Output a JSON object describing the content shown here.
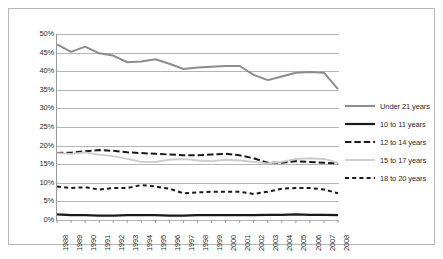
{
  "chart_data": {
    "type": "line",
    "title": "",
    "subtitle": "",
    "xlabel": "",
    "ylabel": "",
    "x": [
      1988,
      1989,
      1990,
      1991,
      1992,
      1993,
      1994,
      1995,
      1996,
      1997,
      1998,
      1999,
      2000,
      2001,
      2002,
      2003,
      2004,
      2005,
      2006,
      2007,
      2008
    ],
    "categories": [
      "1988",
      "1989",
      "1990",
      "1991",
      "1992",
      "1993",
      "1994",
      "1995",
      "1996",
      "1997",
      "1998",
      "1999",
      "2000",
      "2001",
      "2002",
      "2003",
      "2004",
      "2005",
      "2006",
      "2007",
      "2008"
    ],
    "ylim": [
      0,
      50
    ],
    "ytick_values": [
      0,
      5,
      10,
      15,
      20,
      25,
      30,
      35,
      40,
      45,
      50
    ],
    "ytick_labels": [
      "0%",
      "5%",
      "10%",
      "15%",
      "20%",
      "25%",
      "30%",
      "35%",
      "40%",
      "45%",
      "50%"
    ],
    "grid": true,
    "grid_axis": "y",
    "legend_position": "right",
    "series": [
      {
        "name": "Under 21 years",
        "style": "solid",
        "color": "#8c8c8c",
        "width": 2.0,
        "values": [
          47.2,
          45.2,
          46.6,
          44.8,
          44.2,
          42.4,
          42.6,
          43.2,
          42.0,
          40.6,
          41.0,
          41.2,
          41.4,
          41.4,
          39.0,
          37.6,
          38.6,
          39.6,
          39.8,
          39.6,
          35.2
        ]
      },
      {
        "name": "10 to 11 years",
        "style": "solid",
        "color": "#1a1a1a",
        "width": 2.2,
        "values": [
          1.5,
          1.3,
          1.3,
          1.2,
          1.2,
          1.3,
          1.3,
          1.3,
          1.2,
          1.2,
          1.3,
          1.3,
          1.3,
          1.3,
          1.3,
          1.4,
          1.4,
          1.5,
          1.4,
          1.4,
          1.3
        ]
      },
      {
        "name": "12 to 14 years",
        "style": "dashed",
        "color": "#1a1a1a",
        "width": 2.0,
        "values": [
          18.0,
          18.1,
          18.5,
          18.8,
          18.6,
          18.2,
          18.0,
          17.8,
          17.6,
          17.4,
          17.4,
          17.6,
          17.8,
          17.4,
          16.6,
          15.4,
          15.4,
          15.8,
          15.6,
          15.4,
          15.2
        ]
      },
      {
        "name": "15 to 17 years",
        "style": "solid",
        "color": "#cccccc",
        "width": 1.8,
        "values": [
          18.0,
          17.8,
          18.2,
          17.6,
          17.2,
          16.4,
          15.6,
          15.6,
          16.2,
          16.4,
          16.0,
          15.8,
          16.2,
          16.0,
          15.6,
          15.2,
          15.6,
          16.4,
          16.6,
          16.4,
          15.4
        ]
      },
      {
        "name": "18 to 20 years",
        "style": "dotted",
        "color": "#1a1a1a",
        "width": 2.0,
        "values": [
          9.0,
          8.6,
          8.8,
          8.2,
          8.6,
          8.6,
          9.4,
          9.0,
          8.4,
          7.2,
          7.4,
          7.6,
          7.6,
          7.6,
          7.0,
          7.6,
          8.4,
          8.6,
          8.6,
          8.2,
          7.2
        ]
      }
    ]
  },
  "legend": {
    "items": [
      {
        "label": "Under 21 years"
      },
      {
        "label": "10 to 11 years"
      },
      {
        "label": "12 to 14 years"
      },
      {
        "label": "15 to 17 years"
      },
      {
        "label": "18 to 20 years"
      }
    ]
  },
  "colors": {
    "axis": "#9a9a9a",
    "grid": "#b5b5b5",
    "frame": "#b9b9b9",
    "text": "#2b2b2b",
    "background": "#ffffff"
  }
}
